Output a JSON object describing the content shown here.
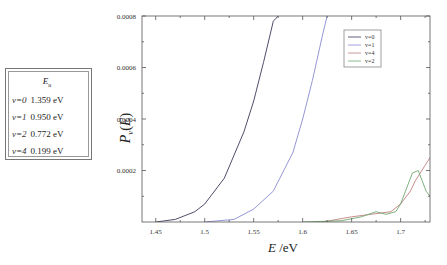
{
  "energy_table": {
    "header": "E_u",
    "header_main": "E",
    "header_sub": "u",
    "rows": [
      {
        "level": "v=0",
        "energy": "1.359 eV"
      },
      {
        "level": "v=1",
        "energy": "0.950 eV"
      },
      {
        "level": "v=2",
        "energy": "0.772 eV"
      },
      {
        "level": "v=4",
        "energy": "0.199 eV"
      }
    ]
  },
  "chart_data": {
    "type": "line",
    "title": "",
    "xlabel": "E /eV",
    "ylabel": "P_v(E)",
    "xlim": [
      1.436,
      1.73
    ],
    "ylim": [
      0,
      0.0008
    ],
    "x_ticks": [
      "1.45",
      "1.5",
      "1.55",
      "1.6",
      "1.65",
      "1.7"
    ],
    "y_ticks": [
      "0.0002",
      "0.0004",
      "0.0006",
      "0.0008"
    ],
    "grid": false,
    "legend_position": "upper right",
    "legend": [
      "v=0",
      "v=1",
      "v=4",
      "v=2"
    ],
    "series": [
      {
        "name": "v=0",
        "color": "#3a3a5a",
        "x": [
          1.45,
          1.47,
          1.49,
          1.5,
          1.52,
          1.54,
          1.55,
          1.56,
          1.57,
          1.575
        ],
        "y": [
          0.0,
          1e-05,
          4e-05,
          7e-05,
          0.00017,
          0.00035,
          0.00047,
          0.00062,
          0.00078,
          0.0008
        ]
      },
      {
        "name": "v=1",
        "color": "#8a8ad0",
        "x": [
          1.5,
          1.53,
          1.55,
          1.57,
          1.59,
          1.6,
          1.61,
          1.62,
          1.625
        ],
        "y": [
          0.0,
          1e-05,
          5e-05,
          0.00012,
          0.00027,
          0.0004,
          0.00055,
          0.00072,
          0.0008
        ]
      },
      {
        "name": "v=4",
        "color": "#c08080",
        "x": [
          1.62,
          1.65,
          1.67,
          1.69,
          1.7,
          1.71,
          1.715,
          1.72,
          1.725,
          1.73
        ],
        "y": [
          0.0,
          2e-05,
          3e-05,
          4e-05,
          7e-05,
          0.00012,
          0.00016,
          0.00019,
          0.00022,
          0.00025
        ]
      },
      {
        "name": "v=2",
        "color": "#70a870",
        "x": [
          1.6,
          1.64,
          1.66,
          1.675,
          1.685,
          1.695,
          1.7,
          1.705,
          1.712,
          1.718,
          1.722,
          1.726,
          1.73
        ],
        "y": [
          0.0,
          5e-06,
          2e-05,
          4e-05,
          3e-05,
          4e-05,
          7e-05,
          0.00012,
          0.00019,
          0.0002,
          0.00016,
          0.00012,
          0.0001
        ]
      }
    ]
  }
}
